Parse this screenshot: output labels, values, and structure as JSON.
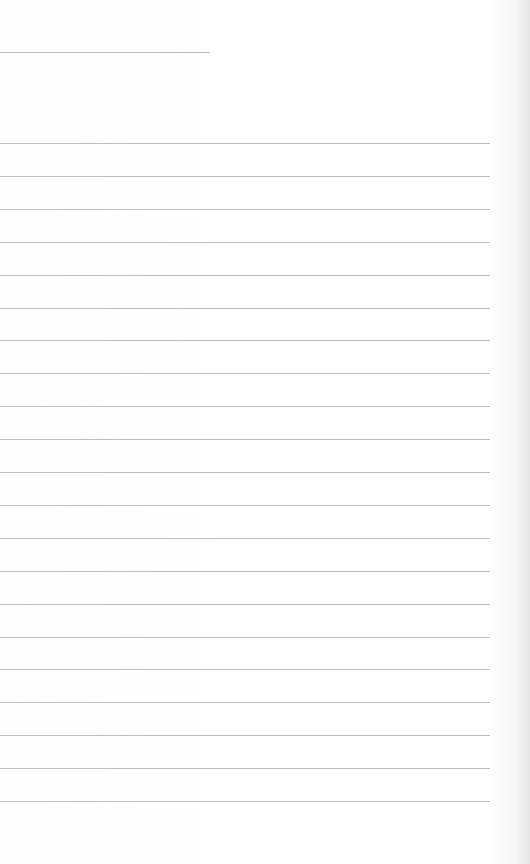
{
  "document": {
    "type": "lined-paper",
    "header_line": {
      "top": 52,
      "width": 210
    },
    "rules": {
      "count": 21,
      "first_top": 143,
      "spacing": 32.9,
      "width": 490,
      "color": "#bdbdbd"
    },
    "text_content": []
  }
}
